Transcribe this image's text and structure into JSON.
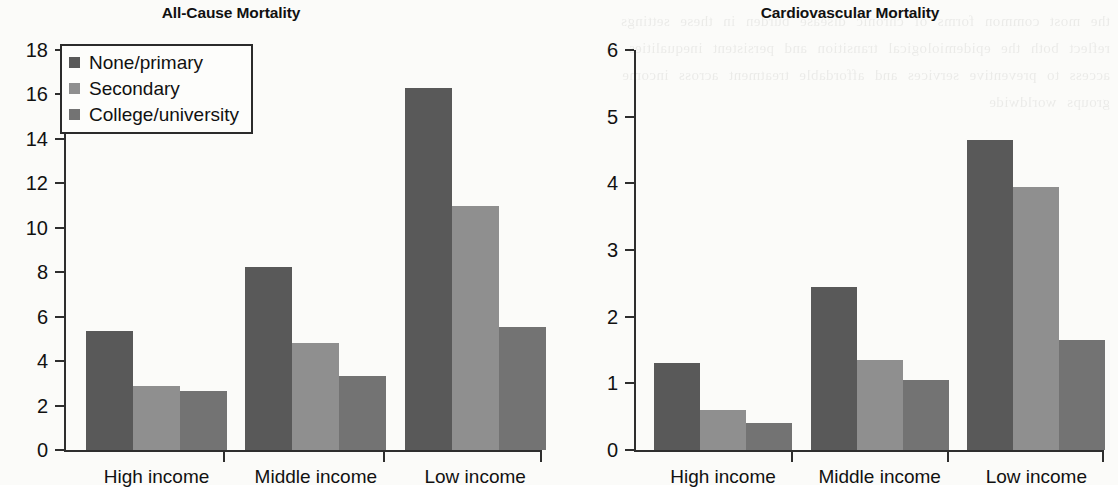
{
  "chart_data": [
    {
      "type": "bar",
      "title": "All-Cause Mortality",
      "xlabel": "",
      "ylabel": "",
      "ylim": [
        0,
        18
      ],
      "yticks": [
        0,
        2,
        4,
        6,
        8,
        10,
        12,
        14,
        16,
        18
      ],
      "ytick_labels": [
        "0",
        "2",
        "4",
        "6",
        "8",
        "10",
        "12",
        "14",
        "16",
        "18"
      ],
      "grid": false,
      "legend_position": "upper-left",
      "categories": [
        "High income",
        "Middle income",
        "Low income"
      ],
      "series": [
        {
          "name": "None/primary",
          "color": "#595959",
          "values": [
            5.35,
            8.25,
            16.3
          ]
        },
        {
          "name": "Secondary",
          "color": "#8f8f8f",
          "values": [
            2.9,
            4.8,
            11.0
          ]
        },
        {
          "name": "College/university",
          "color": "#737373",
          "values": [
            2.65,
            3.35,
            5.55
          ]
        }
      ]
    },
    {
      "type": "bar",
      "title": "Cardiovascular Mortality",
      "xlabel": "",
      "ylabel": "",
      "ylim": [
        0,
        6
      ],
      "yticks": [
        0,
        1,
        2,
        3,
        4,
        5,
        6
      ],
      "ytick_labels": [
        "0",
        "1",
        "2",
        "3",
        "4",
        "5",
        "6"
      ],
      "grid": false,
      "legend_position": "none",
      "categories": [
        "High income",
        "Middle income",
        "Low income"
      ],
      "series": [
        {
          "name": "None/primary",
          "color": "#595959",
          "values": [
            1.3,
            2.45,
            4.65
          ]
        },
        {
          "name": "Secondary",
          "color": "#8f8f8f",
          "values": [
            0.6,
            1.35,
            3.95
          ]
        },
        {
          "name": "College/university",
          "color": "#737373",
          "values": [
            0.4,
            1.05,
            1.65
          ]
        }
      ]
    }
  ],
  "legend": {
    "items": [
      {
        "label": "None/primary",
        "color": "#595959"
      },
      {
        "label": "Secondary",
        "color": "#8f8f8f"
      },
      {
        "label": "College/university",
        "color": "#737373"
      }
    ]
  },
  "bleed_text": "the most common forms of chronic disease burden in these settings reflect both the epidemiological transition and persistent inequalities in access to preventive services and affordable treatment across income groups worldwide"
}
